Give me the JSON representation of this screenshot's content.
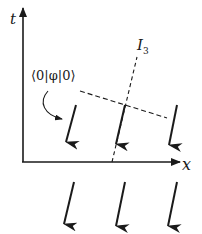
{
  "diagram": {
    "axes": {
      "vertical_label": "t",
      "horizontal_label": "x"
    },
    "labels": {
      "vev": "⟨0|φ|0⟩",
      "isospin_axis_main": "I",
      "isospin_axis_sub": "3"
    },
    "spin_arrows": {
      "count_per_row": 3,
      "rows": 2,
      "direction": "down-left"
    },
    "colors": {
      "ink": "#1a1a1a",
      "background": "#ffffff"
    }
  }
}
